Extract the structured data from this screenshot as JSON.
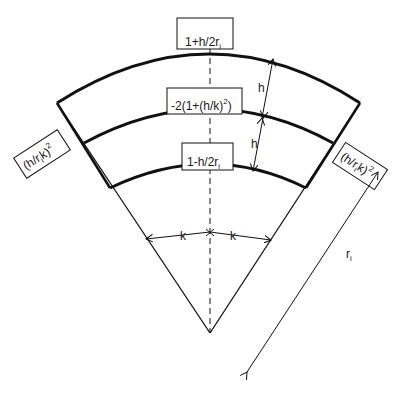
{
  "diagram": {
    "type": "finite-difference stencil on polar sector",
    "coefficients": {
      "top": {
        "main": "1+h/2r",
        "sub": "i"
      },
      "center": {
        "main": "-2(1+(h/k)",
        "sup": "2",
        "close": ")"
      },
      "bottom": {
        "main": "1-h/2r",
        "sub": "i"
      },
      "left": {
        "open": "(h/r",
        "sub": "i",
        "mid": "k)",
        "sup": "2"
      },
      "right": {
        "open": "(h/r",
        "sub": "i",
        "mid": "k)",
        "sup": "2"
      }
    },
    "dimensions": {
      "h_upper": "h",
      "h_lower": "h",
      "k_left": "k",
      "k_right": "k",
      "radius": {
        "main": "r",
        "sub": "i"
      }
    },
    "colors": {
      "line": "#111111",
      "background": "#ffffff"
    }
  }
}
